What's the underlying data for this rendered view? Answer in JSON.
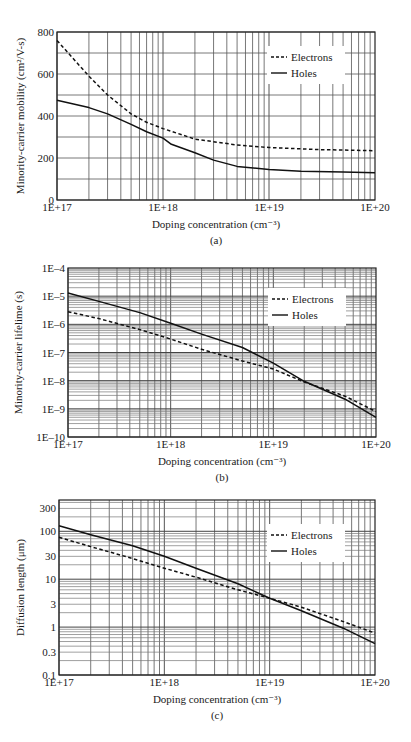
{
  "chart_data": [
    {
      "id": "a",
      "type": "line",
      "caption": "(a)",
      "xlabel": "Doping concentration (cm⁻³)",
      "ylabel": "Minority-carrier mobility (cm²/V-s)",
      "xscale": "log",
      "yscale": "linear",
      "xlim": [
        1e+17,
        1e+20
      ],
      "ylim": [
        0,
        800
      ],
      "xticks": [
        {
          "v": 1e+17,
          "label": "1E+17"
        },
        {
          "v": 1e+18,
          "label": "1E+18"
        },
        {
          "v": 1e+19,
          "label": "1E+19"
        },
        {
          "v": 1e+20,
          "label": "1E+20"
        }
      ],
      "yticks": [
        {
          "v": 0,
          "label": "0"
        },
        {
          "v": 200,
          "label": "200"
        },
        {
          "v": 400,
          "label": "400"
        },
        {
          "v": 600,
          "label": "600"
        },
        {
          "v": 800,
          "label": "800"
        }
      ],
      "ygrid_minor": [
        100,
        300,
        500,
        700
      ],
      "grid": true,
      "legend": {
        "position": "upper right",
        "entries": [
          "Electrons",
          "Holes"
        ]
      },
      "series": [
        {
          "name": "Electrons",
          "style": "dashed",
          "x": [
            1e+17,
            1.5e+17,
            2e+17,
            3e+17,
            5e+17,
            7e+17,
            1e+18,
            2e+18,
            5e+18,
            1e+19,
            3e+19,
            1e+20
          ],
          "y": [
            760,
            660,
            590,
            500,
            410,
            370,
            340,
            290,
            262,
            250,
            240,
            235
          ]
        },
        {
          "name": "Holes",
          "style": "solid",
          "x": [
            1e+17,
            1.5e+17,
            2e+17,
            3e+17,
            5e+17,
            7e+17,
            1e+18,
            1.2e+18,
            2e+18,
            3e+18,
            5e+18,
            1e+19,
            2e+19,
            5e+19,
            1e+20
          ],
          "y": [
            475,
            455,
            440,
            410,
            360,
            325,
            295,
            265,
            225,
            190,
            160,
            145,
            137,
            133,
            130
          ]
        }
      ]
    },
    {
      "id": "b",
      "type": "line",
      "caption": "(b)",
      "xlabel": "Doping concentration (cm⁻³)",
      "ylabel": "Minority-carrier lifelime (s)",
      "xscale": "log",
      "yscale": "log",
      "xlim": [
        1e+17,
        1e+20
      ],
      "ylim": [
        1e-10,
        0.0001
      ],
      "xticks": [
        {
          "v": 1e+17,
          "label": "1E+17"
        },
        {
          "v": 1e+18,
          "label": "1E+18"
        },
        {
          "v": 1e+19,
          "label": "1E+19"
        },
        {
          "v": 1e+20,
          "label": "1E+20"
        }
      ],
      "yticks": [
        {
          "v": 1e-10,
          "label": "1E–10"
        },
        {
          "v": 1e-09,
          "label": "1E–9"
        },
        {
          "v": 1e-08,
          "label": "1E–8"
        },
        {
          "v": 1e-07,
          "label": "1E–7"
        },
        {
          "v": 1e-06,
          "label": "1E–6"
        },
        {
          "v": 1e-05,
          "label": "1E–5"
        },
        {
          "v": 0.0001,
          "label": "1E–4"
        }
      ],
      "grid": true,
      "legend": {
        "position": "upper right",
        "entries": [
          "Electrons",
          "Holes"
        ]
      },
      "series": [
        {
          "name": "Electrons",
          "style": "dashed",
          "x": [
            1e+17,
            2e+17,
            5e+17,
            1e+18,
            2e+18,
            5e+18,
            1e+19,
            2e+19,
            5e+19,
            1e+20
          ],
          "y": [
            2.8e-06,
            1.6e-06,
            6.5e-07,
            3e-07,
            1.3e-07,
            5e-08,
            2.6e-08,
            9e-09,
            2.8e-09,
            8e-10
          ]
        },
        {
          "name": "Holes",
          "style": "solid",
          "x": [
            1e+17,
            2e+17,
            5e+17,
            1e+18,
            2e+18,
            5e+18,
            1e+19,
            2e+19,
            5e+19,
            1e+20
          ],
          "y": [
            1.3e-05,
            6.5e-06,
            2.6e-06,
            1.1e-06,
            4.5e-07,
            1.5e-07,
            4.2e-08,
            9.5e-09,
            2.2e-09,
            5e-10
          ]
        }
      ]
    },
    {
      "id": "c",
      "type": "line",
      "caption": "(c)",
      "xlabel": "Doping concentration (cm⁻³)",
      "ylabel": "Diffusion length (μm)",
      "xscale": "log",
      "yscale": "log",
      "xlim": [
        1e+17,
        1e+20
      ],
      "ylim": [
        0.1,
        450
      ],
      "xticks": [
        {
          "v": 1e+17,
          "label": "1E+17"
        },
        {
          "v": 1e+18,
          "label": "1E+18"
        },
        {
          "v": 1e+19,
          "label": "1E+19"
        },
        {
          "v": 1e+20,
          "label": "1E+20"
        }
      ],
      "yticks": [
        {
          "v": 0.1,
          "label": "0.1"
        },
        {
          "v": 0.3,
          "label": "0.3"
        },
        {
          "v": 1,
          "label": "1"
        },
        {
          "v": 3,
          "label": "3"
        },
        {
          "v": 10,
          "label": "10"
        },
        {
          "v": 30,
          "label": "30"
        },
        {
          "v": 100,
          "label": "100"
        },
        {
          "v": 300,
          "label": "300"
        }
      ],
      "grid": true,
      "legend": {
        "position": "upper right",
        "entries": [
          "Electrons",
          "Holes"
        ]
      },
      "series": [
        {
          "name": "Electrons",
          "style": "dashed",
          "x": [
            1e+17,
            2e+17,
            5e+17,
            1e+18,
            2e+18,
            5e+18,
            1e+19,
            2e+19,
            5e+19,
            1e+20
          ],
          "y": [
            75,
            48,
            27,
            17,
            11,
            6,
            4,
            2.6,
            1.3,
            0.75
          ]
        },
        {
          "name": "Holes",
          "style": "solid",
          "x": [
            1e+17,
            2e+17,
            5e+17,
            1e+18,
            2e+18,
            5e+18,
            1e+19,
            2e+19,
            5e+19,
            1e+20
          ],
          "y": [
            130,
            85,
            50,
            30,
            17,
            8,
            4,
            2.2,
            0.95,
            0.45
          ]
        }
      ]
    }
  ],
  "layout": [
    {
      "top": 0,
      "height": 248,
      "plot": {
        "x0": 57,
        "y0": 32,
        "x1": 375,
        "y1": 200
      }
    },
    {
      "top": 248,
      "height": 242,
      "plot": {
        "x0": 68,
        "y0": 20,
        "x1": 376,
        "y1": 189
      }
    },
    {
      "top": 490,
      "height": 252,
      "plot": {
        "x0": 59,
        "y0": 10,
        "x1": 375,
        "y1": 185
      }
    }
  ]
}
